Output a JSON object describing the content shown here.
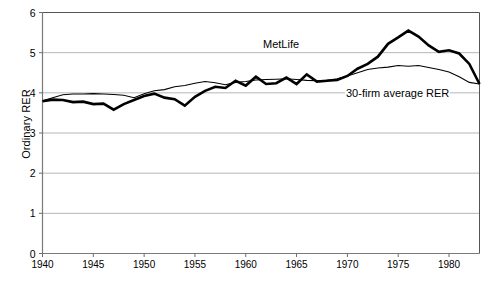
{
  "chart_data": {
    "type": "line",
    "title": "",
    "xlabel": "",
    "ylabel": "Ordinary RER",
    "xlim": [
      1940,
      1983
    ],
    "ylim": [
      0,
      6
    ],
    "grid": true,
    "gridlines_y": [
      1,
      2,
      3,
      4,
      5
    ],
    "legend_position": "inline-annotations",
    "xticks": [
      1940,
      1945,
      1950,
      1955,
      1960,
      1965,
      1970,
      1975,
      1980
    ],
    "yticks": [
      0,
      1,
      2,
      3,
      4,
      5,
      6
    ],
    "x": [
      1940,
      1941,
      1942,
      1943,
      1944,
      1945,
      1946,
      1947,
      1948,
      1949,
      1950,
      1951,
      1952,
      1953,
      1954,
      1955,
      1956,
      1957,
      1958,
      1959,
      1960,
      1961,
      1962,
      1963,
      1964,
      1965,
      1966,
      1967,
      1968,
      1969,
      1970,
      1971,
      1972,
      1973,
      1974,
      1975,
      1976,
      1977,
      1978,
      1979,
      1980,
      1981,
      1982,
      1983
    ],
    "series": [
      {
        "name": "MetLife",
        "style": "thick",
        "color": "#000000",
        "values": [
          3.79,
          3.83,
          3.82,
          3.77,
          3.78,
          3.72,
          3.73,
          3.58,
          3.72,
          3.82,
          3.92,
          3.98,
          3.88,
          3.84,
          3.68,
          3.9,
          4.05,
          4.15,
          4.12,
          4.3,
          4.18,
          4.4,
          4.22,
          4.24,
          4.38,
          4.22,
          4.46,
          4.28,
          4.3,
          4.32,
          4.42,
          4.6,
          4.72,
          4.9,
          5.22,
          5.38,
          5.55,
          5.4,
          5.18,
          5.02,
          5.06,
          4.98,
          4.72,
          4.22
        ]
      },
      {
        "name": "30-firm average RER",
        "style": "thin",
        "color": "#000000",
        "values": [
          3.8,
          3.88,
          3.95,
          3.97,
          3.97,
          3.98,
          3.97,
          3.96,
          3.94,
          3.88,
          3.98,
          4.05,
          4.08,
          4.15,
          4.18,
          4.24,
          4.28,
          4.25,
          4.2,
          4.26,
          4.28,
          4.32,
          4.33,
          4.34,
          4.35,
          4.33,
          4.31,
          4.3,
          4.31,
          4.35,
          4.42,
          4.5,
          4.58,
          4.62,
          4.64,
          4.68,
          4.66,
          4.68,
          4.63,
          4.58,
          4.52,
          4.4,
          4.26,
          4.22
        ]
      }
    ],
    "annotations": [
      {
        "name": "MetLife",
        "text": "MetLife"
      },
      {
        "name": "30-firm average RER",
        "text": "30-firm average RER"
      }
    ]
  }
}
